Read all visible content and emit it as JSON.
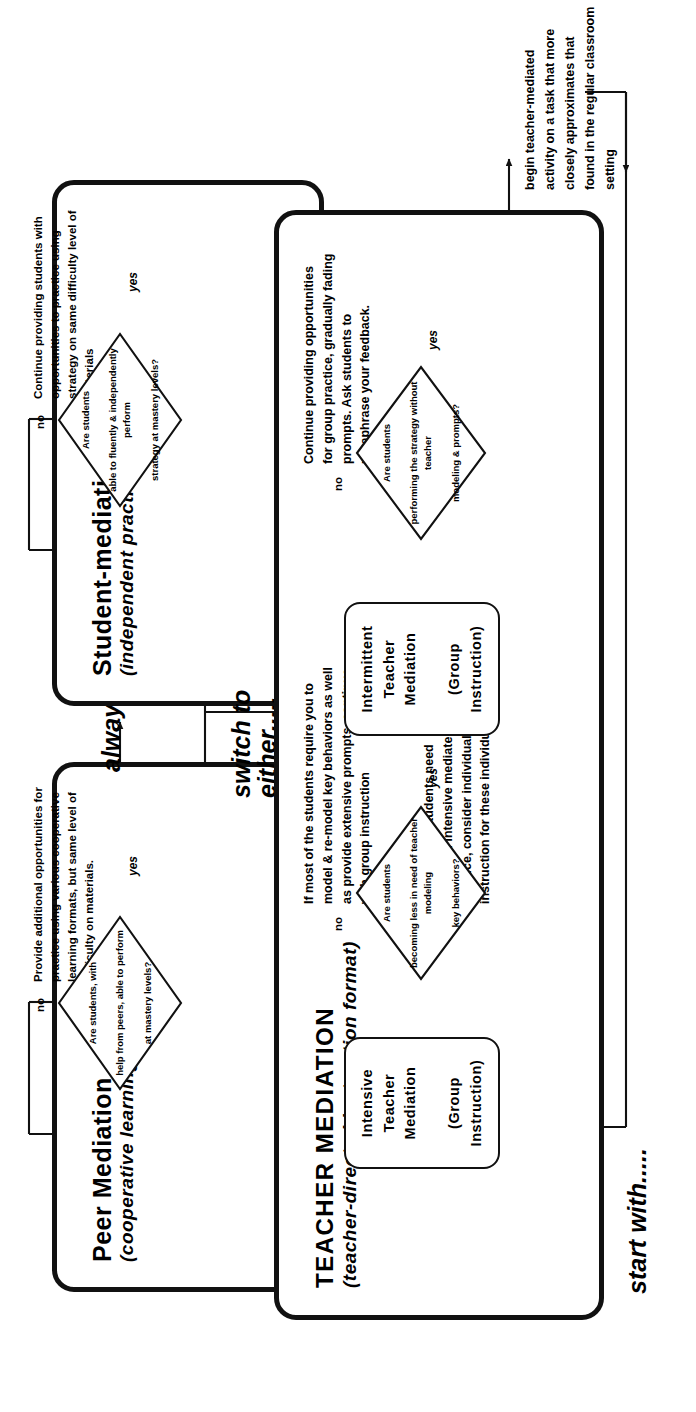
{
  "diagram": {
    "orientation": "rotated-90",
    "ink_color": "#111111",
    "paper_color": "#ffffff"
  },
  "connectors": {
    "start_with": "start with.....",
    "switch_to_either": "switch to\neither.....",
    "switch_to_either_line1": "switch to",
    "switch_to_either_line2": "either.....",
    "always_ends_with": "always ends with....",
    "yes": "yes",
    "no": "no",
    "entry_note_line1": "begin teacher-mediated activity on a task that more",
    "entry_note_line2": "closely approximates that found in the regular classroom setting"
  },
  "phases": [
    {
      "id": "teacher-mediation",
      "title": "TEACHER MEDIATION",
      "subtitle": "(teacher-directed instruction format)",
      "steps": [
        {
          "id": "intensive",
          "box_line1": "Intensive Teacher Mediation",
          "box_line2": "(Group Instruction)",
          "decision": "Are students becoming less in need of teacher modeling key behaviors?",
          "decision_line1": "Are students",
          "decision_line2": "becoming less in need of teacher modeling",
          "decision_line3": "key behaviors?",
          "no_label": "no",
          "yes_label": "yes",
          "no_note": "If most of the students require you to model & re-model key behaviors as well as provide extensive prompts, continue with group instruction",
          "extra_note": "If only a few students need additional intensive mediated practice, consider individual instruction for these individuals"
        },
        {
          "id": "intermittent",
          "box_line1": "Intermittent Teacher Mediation",
          "box_line2": "(Group Instruction)",
          "decision": "Are students performing the strategy without teacher modeling & prompts?",
          "decision_line1": "Are students",
          "decision_line2": "performing the strategy without teacher",
          "decision_line3": "modeling & prompts?",
          "no_label": "no",
          "yes_label": "yes",
          "no_note": "Continue providing opportunities for group practice, gradually fading prompts. Ask students to paraphrase your feedback."
        }
      ]
    },
    {
      "id": "peer-mediation",
      "title": "Peer Mediation",
      "subtitle": "(cooperative learning format)",
      "steps": [
        {
          "id": "peer",
          "decision": "Are students, with help from peers, able to perform at mastery levels?",
          "decision_line1": "Are students, with",
          "decision_line2": "help from peers, able to perform",
          "decision_line3": "at mastery levels?",
          "no_label": "no",
          "yes_label": "yes",
          "no_note": "Provide additional opportunities for practice using various cooperative learning formats, but same level of difficulty on materials."
        }
      ]
    },
    {
      "id": "student-mediation",
      "title": "Student-mediation",
      "subtitle": "(independent practice)",
      "steps": [
        {
          "id": "student",
          "decision": "Are students able to fluently & independently perform strategy at mastery levels?",
          "decision_line1": "Are students",
          "decision_line2": "able to fluently & independently perform",
          "decision_line3": "strategy at mastery levels?",
          "no_label": "no",
          "yes_label": "yes",
          "no_note": "Continue providing students with opportunities to practice using strategy on same difficulty level of materials"
        }
      ]
    }
  ]
}
